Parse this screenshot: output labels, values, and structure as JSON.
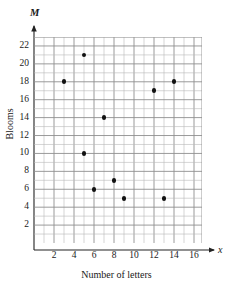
{
  "chart_data": {
    "type": "scatter",
    "title": "",
    "xlabel": "Number of letters",
    "ylabel": "Blooms",
    "x_axis_variable": "x",
    "y_axis_variable": "M",
    "xlim": [
      0,
      16.8
    ],
    "ylim": [
      0,
      23
    ],
    "xticks": [
      2,
      4,
      6,
      8,
      10,
      12,
      14,
      16
    ],
    "yticks": [
      2,
      4,
      6,
      8,
      10,
      12,
      14,
      16,
      18,
      20,
      22
    ],
    "xtick_labels": [
      "2",
      "4",
      "6",
      "8",
      "10",
      "12",
      "14",
      "16"
    ],
    "ytick_labels": [
      "2",
      "4",
      "6",
      "8",
      "10",
      "12",
      "14",
      "16",
      "18",
      "20",
      "22"
    ],
    "grid": true,
    "grid_minor_step": 1,
    "grid_major_step": 2,
    "legend": "none",
    "point_color": "#111111",
    "grid_color": "#b9b9b9",
    "grid_major_color": "#8f8f8f",
    "axis_color": "#222222",
    "points": [
      {
        "x": 3,
        "y": 18
      },
      {
        "x": 5,
        "y": 21
      },
      {
        "x": 5,
        "y": 10
      },
      {
        "x": 6,
        "y": 6
      },
      {
        "x": 7,
        "y": 14
      },
      {
        "x": 8,
        "y": 7
      },
      {
        "x": 9,
        "y": 5
      },
      {
        "x": 12,
        "y": 17
      },
      {
        "x": 13,
        "y": 5
      },
      {
        "x": 14,
        "y": 18
      }
    ]
  }
}
